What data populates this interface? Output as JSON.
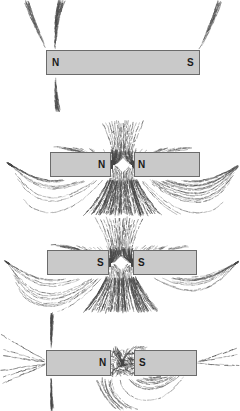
{
  "figure": {
    "background_color": "#ffffff",
    "width": 240,
    "height": 411,
    "magnet_fill_color": "#c9c9c9",
    "magnet_border_color": "#6b6b6b",
    "filing_color": "#4a4a4a",
    "label_color": "#1b1b1b"
  },
  "panels": [
    {
      "id": "panel-single-magnet",
      "caption": "Single bar magnet field pattern",
      "arrangement": "single",
      "top": 0,
      "height": 112,
      "magnets": [
        {
          "x": 46,
          "y": 50,
          "width": 154,
          "height": 25,
          "poles": [
            {
              "label": "N",
              "x": 52,
              "y": 58
            },
            {
              "label": "S",
              "x": 187,
              "y": 58
            }
          ]
        }
      ],
      "gap": null,
      "field_type": "dipole"
    },
    {
      "id": "panel-north-north",
      "caption": "Like poles N-N repelling",
      "arrangement": "pair",
      "top": 118,
      "height": 100,
      "magnets": [
        {
          "x": 50,
          "y": 152,
          "width": 61,
          "height": 25,
          "poles": [
            {
              "label": "N",
              "x": 98,
              "y": 160
            }
          ]
        },
        {
          "x": 134,
          "y": 152,
          "width": 66,
          "height": 25,
          "poles": [
            {
              "label": "N",
              "x": 138,
              "y": 160
            }
          ]
        }
      ],
      "gap": {
        "x": 111,
        "y": 152,
        "width": 23,
        "height": 25
      },
      "field_type": "repel"
    },
    {
      "id": "panel-south-south",
      "caption": "Like poles S-S repelling",
      "arrangement": "pair",
      "top": 215,
      "height": 100,
      "magnets": [
        {
          "x": 47,
          "y": 250,
          "width": 62,
          "height": 25,
          "poles": [
            {
              "label": "S",
              "x": 97,
              "y": 258
            }
          ]
        },
        {
          "x": 133,
          "y": 250,
          "width": 64,
          "height": 25,
          "poles": [
            {
              "label": "S",
              "x": 138,
              "y": 258
            }
          ]
        }
      ],
      "gap": {
        "x": 109,
        "y": 250,
        "width": 24,
        "height": 25
      },
      "field_type": "repel"
    },
    {
      "id": "panel-north-south",
      "caption": "Unlike poles N-S attracting",
      "arrangement": "pair",
      "top": 312,
      "height": 99,
      "magnets": [
        {
          "x": 46,
          "y": 350,
          "width": 65,
          "height": 26,
          "poles": [
            {
              "label": "N",
              "x": 99,
              "y": 358
            }
          ]
        },
        {
          "x": 134,
          "y": 350,
          "width": 63,
          "height": 26,
          "poles": [
            {
              "label": "S",
              "x": 139,
              "y": 358
            }
          ]
        }
      ],
      "gap": {
        "x": 111,
        "y": 350,
        "width": 23,
        "height": 26
      },
      "field_type": "attract"
    }
  ]
}
